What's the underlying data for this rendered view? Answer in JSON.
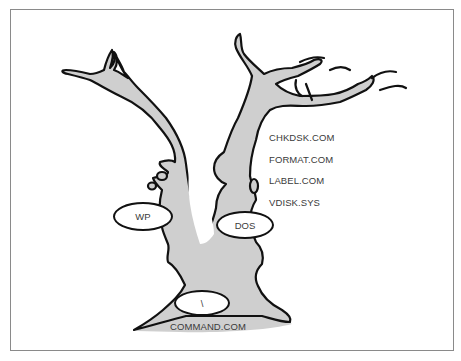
{
  "diagram": {
    "type": "directory-tree-illustration",
    "colors": {
      "trunk_fill": "#cfcfcf",
      "outline": "#111111",
      "frame": "#8a8a8a",
      "text": "#3a3a3a"
    },
    "nodes": {
      "root": {
        "label": "\\",
        "file": "COMMAND.COM"
      },
      "wp": {
        "label": "WP"
      },
      "dos": {
        "label": "DOS",
        "files": [
          "CHKDSK.COM",
          "FORMAT.COM",
          "LABEL.COM",
          "VDISK.SYS"
        ]
      }
    }
  }
}
